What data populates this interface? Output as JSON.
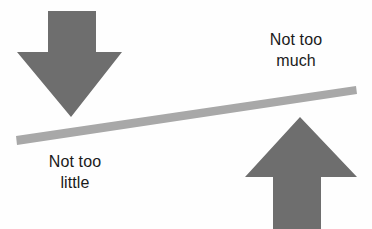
{
  "diagram": {
    "background_color": "#fefefe",
    "arrow_color": "#6e6e6e",
    "beam_color": "#a8a8a8",
    "text_color": "#1a1a1a"
  },
  "labels": {
    "too_much": {
      "line1": "Not too",
      "line2": "much"
    },
    "too_little": {
      "line1": "Not too",
      "line2": "little"
    }
  },
  "shapes": {
    "down_arrow": {
      "name": "down-arrow",
      "points": "48,11 96,11 96,52 122,52 71,117 17,52 48,52"
    },
    "up_arrow": {
      "name": "up-arrow",
      "points": "300,117 357,177 321,177 321,229 273,229 273,177 245,177"
    },
    "beam": {
      "name": "balance-beam",
      "points": "16,136 356,86 357,94 17,145"
    }
  }
}
